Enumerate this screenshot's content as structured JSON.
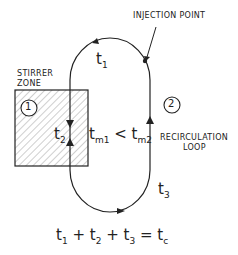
{
  "labels": {
    "injection_point": "INJECTION POINT",
    "stirrer_zone_1": "STIRRER",
    "stirrer_zone_2": "ZONE",
    "zone1": "1",
    "zone2": "2",
    "recirc_1": "RECIRCULATION",
    "recirc_2": "LOOP",
    "t1": "t",
    "t1_sub": "1",
    "t2": "t",
    "t2_sub": "2",
    "t3": "t",
    "t3_sub": "3",
    "tm_relation": {
      "a": "t",
      "a_sub": "m1",
      "op": "<",
      "b": "t",
      "b_sub": "m2"
    },
    "equation": {
      "p1": "t",
      "s1": "1",
      "plus1": "+",
      "p2": "t",
      "s2": "2",
      "plus2": "+",
      "p3": "t",
      "s3": "3",
      "eq": "=",
      "p4": "t",
      "s4": "c"
    }
  },
  "colors": {
    "line": "#222222",
    "hatch": "#777777"
  }
}
